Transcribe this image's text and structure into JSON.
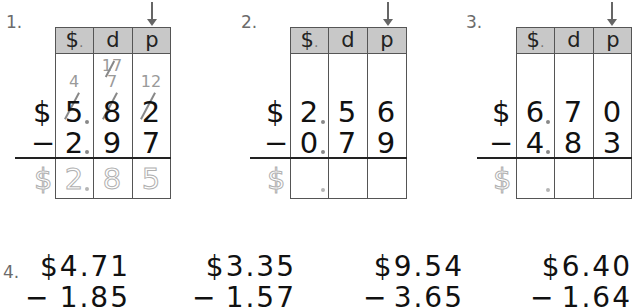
{
  "header_labels": {
    "dollars": "$",
    "dot": ".",
    "dimes": "d",
    "pennies": "p"
  },
  "problems": [
    {
      "number": "1.",
      "top": {
        "sign": "$",
        "d1": "5",
        "d2": "8",
        "d3": "2"
      },
      "bottom": {
        "sign": "−",
        "d1": "2",
        "d2": "9",
        "d3": "7"
      },
      "regroup": {
        "d1": "4",
        "d2_top": "17",
        "d2": "7",
        "d3": "12"
      },
      "answer": {
        "sign": "$",
        "d1": "2",
        "d2": "8",
        "d3": "5"
      },
      "solved": true
    },
    {
      "number": "2.",
      "top": {
        "sign": "$",
        "d1": "2",
        "d2": "5",
        "d3": "6"
      },
      "bottom": {
        "sign": "−",
        "d1": "0",
        "d2": "7",
        "d3": "9"
      },
      "answer": {
        "sign": "$"
      },
      "solved": false
    },
    {
      "number": "3.",
      "top": {
        "sign": "$",
        "d1": "6",
        "d2": "7",
        "d3": "0"
      },
      "bottom": {
        "sign": "−",
        "d1": "4",
        "d2": "8",
        "d3": "3"
      },
      "answer": {
        "sign": "$"
      },
      "solved": false
    }
  ],
  "problem4": {
    "number": "4.",
    "items": [
      {
        "top": "$4.71",
        "bottom": "1.85",
        "op": "−"
      },
      {
        "top": "$3.35",
        "bottom": "1.57",
        "op": "−"
      },
      {
        "top": "$9.54",
        "bottom": "3.65",
        "op": "−"
      },
      {
        "top": "$6.40",
        "bottom": "1.64",
        "op": "−"
      }
    ]
  }
}
